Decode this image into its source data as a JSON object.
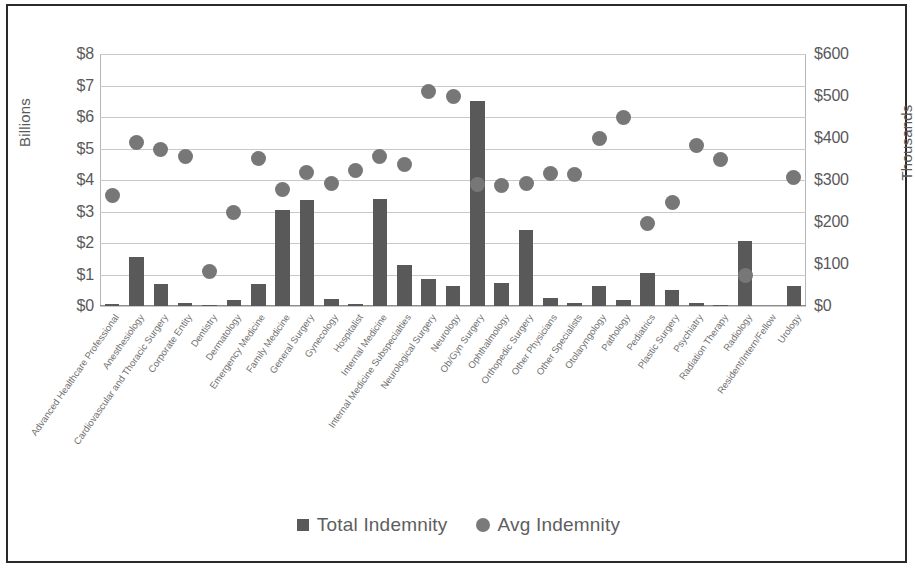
{
  "chart_data": {
    "type": "bar",
    "title": "",
    "subtitle": "",
    "xlabel": "",
    "ylabel": "Billions",
    "y2label": "Thousands",
    "grid": true,
    "legend_position": "bottom",
    "ylim": [
      0,
      8
    ],
    "y2lim": [
      0,
      600
    ],
    "yticks": [
      "$0",
      "$1",
      "$2",
      "$3",
      "$4",
      "$5",
      "$6",
      "$7",
      "$8"
    ],
    "ytick_values": [
      0,
      1,
      2,
      3,
      4,
      5,
      6,
      7,
      8
    ],
    "y2ticks": [
      "$0",
      "$100",
      "$200",
      "$300",
      "$400",
      "$500",
      "$600"
    ],
    "y2tick_values": [
      0,
      100,
      200,
      300,
      400,
      500,
      600
    ],
    "categories": [
      "Advanced Healthcare Professional",
      "Anesthesiology",
      "Cardiovascular and Thoracic Surgery",
      "Corporate Entity",
      "Dentistry",
      "Dermatology",
      "Emergency Medicine",
      "Family Medicine",
      "General Surgery",
      "Gynecology",
      "Hospitalist",
      "Internal Medicine",
      "Internal Medicine Subspecialties",
      "Neurological Surgery",
      "Neurology",
      "Ob/Gyn Surgery",
      "Ophthalmology",
      "Orthopedic Surgery",
      "Other Physicians",
      "Other Specialists",
      "Otolaryngology",
      "Pathology",
      "Pediatrics",
      "Plastic Surgery",
      "Psychiatry",
      "Radiation Therapy",
      "Radiology",
      "Resident/Intern/Fellow",
      "Urology"
    ],
    "series": [
      {
        "name": "Total Indemnity",
        "axis": "left",
        "units": "Billions",
        "marker": "square",
        "color": "#595959",
        "values": [
          0.07,
          1.55,
          0.7,
          0.1,
          0.04,
          0.2,
          0.7,
          3.05,
          3.35,
          0.22,
          0.06,
          3.4,
          1.3,
          0.85,
          0.65,
          6.5,
          0.72,
          2.4,
          0.25,
          0.1,
          0.62,
          0.2,
          1.05,
          0.5,
          0.1,
          0.04,
          2.05,
          0.0,
          0.62
        ]
      },
      {
        "name": "Avg Indemnity",
        "axis": "right",
        "units": "Thousands",
        "marker": "circle",
        "color": "#777777",
        "values": [
          263,
          390,
          372,
          355,
          82,
          222,
          352,
          278,
          318,
          292,
          322,
          355,
          338,
          510,
          500,
          289,
          288,
          292,
          315,
          313,
          398,
          450,
          196,
          246,
          382,
          350,
          73,
          null,
          305
        ]
      }
    ]
  },
  "legend": {
    "items": [
      {
        "label": "Total Indemnity",
        "marker": "square"
      },
      {
        "label": "Avg Indemnity",
        "marker": "circle"
      }
    ]
  }
}
